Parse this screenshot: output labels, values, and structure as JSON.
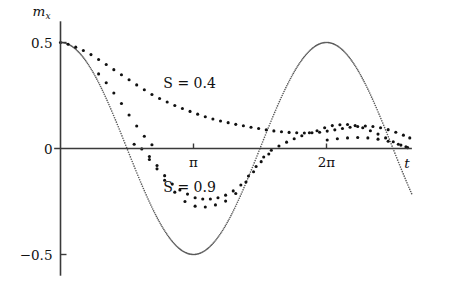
{
  "figure": {
    "background": "#ffffff",
    "ink_color": "#111111",
    "curve_color": "#585858"
  },
  "axes": {
    "y_label": "m",
    "y_label_sub": "x",
    "x_label": "t",
    "y_ticks": [
      {
        "value": 0.5,
        "label": "0.5"
      },
      {
        "value": 0.0,
        "label": "0"
      },
      {
        "value": -0.5,
        "label": "−0.5"
      }
    ],
    "x_ticks": [
      {
        "value": 3.14159,
        "label": "π"
      },
      {
        "value": 6.28319,
        "label": "2π"
      }
    ],
    "xlim": [
      -0.15,
      8.3
    ],
    "ylim": [
      -0.62,
      0.62
    ]
  },
  "annotations": [
    {
      "name": "label-s-04",
      "text": "S = 0.4",
      "x": 3.05,
      "y": 0.285
    },
    {
      "name": "label-s-09",
      "text": "S = 0.9",
      "x": 3.05,
      "y": -0.205
    }
  ],
  "chart_data": {
    "type": "scatter",
    "title": "",
    "xlabel": "t",
    "ylabel": "m_x",
    "xlim": [
      -0.15,
      8.3
    ],
    "ylim": [
      -0.62,
      0.62
    ],
    "grid": false,
    "legend_position": "inline-annotations",
    "reference_curve": {
      "name": "0.5 cos(t)",
      "style": "dotted",
      "color": "#585858",
      "x_start": 0.0,
      "x_end": 8.3,
      "amplitude": 0.5,
      "formula": "0.5*cos(t)"
    },
    "series": [
      {
        "name": "S = 0.4",
        "marker": "dot",
        "color": "#111111",
        "points": [
          [
            0.0,
            0.5
          ],
          [
            0.18,
            0.492
          ],
          [
            0.36,
            0.478
          ],
          [
            0.54,
            0.462
          ],
          [
            0.72,
            0.443
          ],
          [
            0.9,
            0.42
          ],
          [
            1.08,
            0.396
          ],
          [
            1.26,
            0.372
          ],
          [
            1.44,
            0.348
          ],
          [
            1.62,
            0.324
          ],
          [
            1.8,
            0.3
          ],
          [
            1.98,
            0.277
          ],
          [
            2.16,
            0.255
          ],
          [
            2.34,
            0.236
          ],
          [
            2.52,
            0.219
          ],
          [
            2.7,
            0.203
          ],
          [
            2.88,
            0.189
          ],
          [
            3.06,
            0.175
          ],
          [
            3.24,
            0.162
          ],
          [
            3.42,
            0.15
          ],
          [
            3.6,
            0.139
          ],
          [
            3.78,
            0.13
          ],
          [
            3.96,
            0.122
          ],
          [
            4.14,
            0.114
          ],
          [
            4.32,
            0.107
          ],
          [
            4.5,
            0.1
          ],
          [
            4.68,
            0.094
          ],
          [
            4.86,
            0.088
          ],
          [
            5.04,
            0.083
          ],
          [
            5.22,
            0.079
          ],
          [
            5.4,
            0.076
          ],
          [
            5.58,
            0.074
          ],
          [
            5.76,
            0.073
          ],
          [
            5.94,
            0.074
          ],
          [
            6.12,
            0.077
          ],
          [
            6.3,
            0.082
          ],
          [
            6.48,
            0.088
          ],
          [
            6.66,
            0.094
          ],
          [
            6.84,
            0.1
          ],
          [
            7.02,
            0.104
          ],
          [
            7.2,
            0.106
          ],
          [
            7.38,
            0.104
          ],
          [
            7.56,
            0.098
          ],
          [
            7.74,
            0.089
          ],
          [
            7.92,
            0.077
          ],
          [
            8.1,
            0.063
          ],
          [
            8.25,
            0.05
          ]
        ]
      },
      {
        "name": "S = 0.9",
        "marker": "dot",
        "color": "#111111",
        "points": [
          [
            1.74,
            0.02
          ],
          [
            1.92,
            -0.002
          ],
          [
            2.1,
            -0.038
          ],
          [
            2.28,
            -0.08
          ],
          [
            2.46,
            -0.128
          ],
          [
            2.64,
            -0.168
          ],
          [
            2.82,
            -0.196
          ],
          [
            3.0,
            -0.215
          ],
          [
            3.18,
            -0.232
          ],
          [
            3.36,
            -0.238
          ],
          [
            3.54,
            -0.238
          ],
          [
            3.72,
            -0.232
          ],
          [
            3.9,
            -0.22
          ],
          [
            4.08,
            -0.2
          ],
          [
            4.26,
            -0.172
          ],
          [
            4.44,
            -0.13
          ],
          [
            4.62,
            -0.085
          ],
          [
            4.8,
            -0.04
          ],
          [
            4.98,
            -0.008
          ],
          [
            5.16,
            0.012
          ],
          [
            5.34,
            0.03
          ],
          [
            5.52,
            0.046
          ],
          [
            5.7,
            0.06
          ],
          [
            5.88,
            0.074
          ],
          [
            6.06,
            0.084
          ],
          [
            6.24,
            0.098
          ],
          [
            6.42,
            0.108
          ],
          [
            6.6,
            0.112
          ],
          [
            6.78,
            0.113
          ],
          [
            6.96,
            0.108
          ],
          [
            7.14,
            0.098
          ],
          [
            7.32,
            0.084
          ],
          [
            7.5,
            0.068
          ],
          [
            7.68,
            0.05
          ],
          [
            7.86,
            0.032
          ],
          [
            8.04,
            0.016
          ],
          [
            8.2,
            0.004
          ]
        ]
      },
      {
        "name": "S = 0.9 lower branch",
        "marker": "dot",
        "color": "#111111",
        "points": [
          [
            2.1,
            -0.052
          ],
          [
            2.28,
            -0.096
          ],
          [
            2.46,
            -0.15
          ],
          [
            2.7,
            -0.206
          ],
          [
            2.94,
            -0.25
          ],
          [
            3.18,
            -0.272
          ],
          [
            3.42,
            -0.276
          ],
          [
            3.66,
            -0.266
          ],
          [
            3.9,
            -0.248
          ],
          [
            4.14,
            -0.212
          ],
          [
            4.38,
            -0.158
          ],
          [
            4.56,
            -0.11
          ],
          [
            4.74,
            -0.062
          ],
          [
            4.92,
            -0.026
          ]
        ]
      },
      {
        "name": "S = 0.4 lower branch",
        "marker": "dot",
        "color": "#111111",
        "points": [
          [
            0.9,
            0.352
          ],
          [
            1.08,
            0.31
          ],
          [
            1.26,
            0.262
          ],
          [
            1.44,
            0.212
          ],
          [
            1.62,
            0.158
          ],
          [
            1.8,
            0.106
          ],
          [
            1.98,
            0.058
          ],
          [
            2.16,
            0.018
          ],
          [
            6.3,
            0.04
          ],
          [
            6.54,
            0.046
          ],
          [
            6.78,
            0.05
          ],
          [
            7.02,
            0.052
          ],
          [
            7.26,
            0.05
          ],
          [
            7.5,
            0.044
          ],
          [
            7.74,
            0.034
          ],
          [
            7.98,
            0.02
          ],
          [
            8.16,
            0.008
          ]
        ]
      }
    ]
  }
}
